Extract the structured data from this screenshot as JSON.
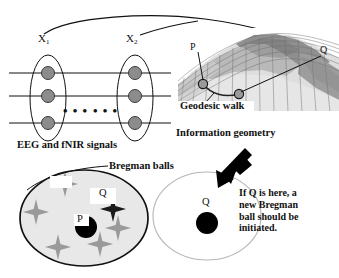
{
  "figure": {
    "title_implicit": "",
    "background_color": "#ffffff",
    "ink_color": "#111111"
  },
  "signals_panel": {
    "group_labels": [
      {
        "name": "X",
        "subscript": "1"
      },
      {
        "name": "X",
        "subscript": "2"
      }
    ],
    "ellipsis_left": "• • •",
    "ellipsis_right": "• • •",
    "caption": "EEG and fNIR signals",
    "channel_count": 3,
    "node_color": "#8c8c8c"
  },
  "manifold_panel": {
    "point_labels": [
      "P",
      "Q"
    ],
    "caption": "Geodesic walk",
    "sub_caption": "Information geometry",
    "surface_colors": {
      "light": "#e2e2e2",
      "mid": "#bdbdbd",
      "dark": "#9a9a9a",
      "darkest": "#7d7d7d"
    }
  },
  "bregman_panel": {
    "title": "Bregman balls",
    "left_ball": {
      "center_label": "P",
      "outlier_label": "Q",
      "fill_color": "#e8e8e8",
      "stroke_color": "#111111",
      "star_count": 6
    },
    "right_ball": {
      "center_label": "Q",
      "fill_color": "#ffffff",
      "stroke_color": "#b5b5b5"
    },
    "note": "If Q is here, a new Bregman ball should be initiated.",
    "arrow": "down-left-arrow"
  }
}
